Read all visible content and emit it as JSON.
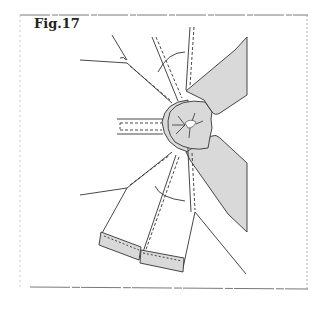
{
  "figure": {
    "label": "Fig.17",
    "type": "sewing-pattern-diagram"
  },
  "colors": {
    "line": "#333333",
    "shade": "#d9d9d9",
    "frame": "#555555",
    "background": "#ffffff"
  }
}
